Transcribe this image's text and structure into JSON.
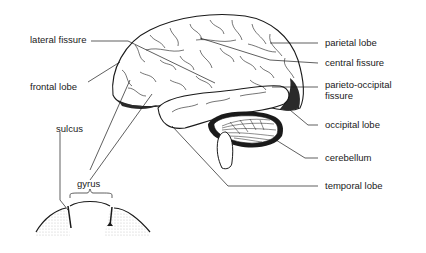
{
  "diagram": {
    "labels_left": {
      "lateral_fissure": "lateral fissure",
      "frontal_lobe": "frontal lobe",
      "sulcus": "sulcus",
      "gyrus": "gyrus"
    },
    "labels_right": {
      "parietal_lobe": "parietal lobe",
      "central_fissure": "central fissure",
      "parieto_occipital_line1": "parieto-occipital",
      "parieto_occipital_line2": "fissure",
      "occipital_lobe": "occipital lobe",
      "cerebellum": "cerebellum",
      "temporal_lobe": "temporal lobe"
    },
    "colors": {
      "ink": "#1a1a1a",
      "background": "#ffffff",
      "stipple": "#d8d8d8"
    }
  }
}
